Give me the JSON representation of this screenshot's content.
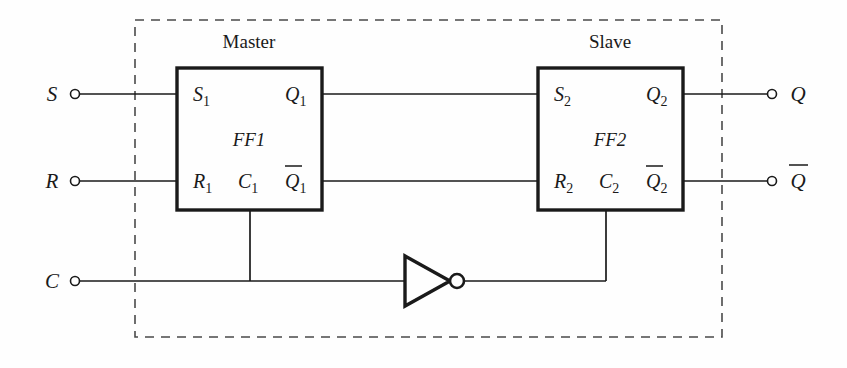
{
  "diagram": {
    "type": "logic-circuit-schematic",
    "background_color": "#fefefe",
    "line_color": "#1a1a1a",
    "dashed_boundary": {
      "present": true,
      "style": "dashed",
      "x": 135,
      "y": 20,
      "width": 587,
      "height": 317
    },
    "inputs": [
      {
        "name": "S",
        "label": "S",
        "terminal": "open-circle",
        "x": 58,
        "y": 94
      },
      {
        "name": "R",
        "label": "R",
        "terminal": "open-circle",
        "x": 58,
        "y": 181
      },
      {
        "name": "C",
        "label": "C",
        "terminal": "open-circle",
        "x": 58,
        "y": 281
      }
    ],
    "outputs": [
      {
        "name": "Q",
        "label": "Q",
        "overbar": false,
        "terminal": "open-circle",
        "x": 789,
        "y": 94
      },
      {
        "name": "Qbar",
        "label": "Q",
        "overbar": true,
        "terminal": "open-circle",
        "x": 789,
        "y": 181
      }
    ],
    "blocks": [
      {
        "id": "master",
        "title": "Master",
        "inner_label": "FF1",
        "x": 177,
        "y": 68,
        "width": 145,
        "height": 142,
        "pins": {
          "set": {
            "label": "S",
            "subscript": "1"
          },
          "reset": {
            "label": "R",
            "subscript": "1"
          },
          "clock": {
            "label": "C",
            "subscript": "1"
          },
          "q": {
            "label": "Q",
            "subscript": "1",
            "overbar": false
          },
          "qbar": {
            "label": "Q",
            "subscript": "1",
            "overbar": true
          }
        }
      },
      {
        "id": "slave",
        "title": "Slave",
        "inner_label": "FF2",
        "x": 538,
        "y": 68,
        "width": 145,
        "height": 142,
        "pins": {
          "set": {
            "label": "S",
            "subscript": "2"
          },
          "reset": {
            "label": "R",
            "subscript": "2"
          },
          "clock": {
            "label": "C",
            "subscript": "2"
          },
          "q": {
            "label": "Q",
            "subscript": "2",
            "overbar": false
          },
          "qbar": {
            "label": "Q",
            "subscript": "2",
            "overbar": true
          }
        }
      }
    ],
    "gates": [
      {
        "id": "clock-inverter",
        "type": "inverter",
        "label": "NOT",
        "x": 405,
        "y": 256,
        "width": 47,
        "height": 50,
        "bubble_radius": 7
      }
    ],
    "wires": [
      {
        "id": "s-to-master-s1",
        "from": "S",
        "to": "S1"
      },
      {
        "id": "r-to-master-r1",
        "from": "R",
        "to": "R1"
      },
      {
        "id": "c-to-master-c1",
        "from": "C",
        "to": "C1"
      },
      {
        "id": "c-to-inverter",
        "from": "C",
        "to": "inverter-input"
      },
      {
        "id": "inverter-to-slave-c2",
        "from": "inverter-output",
        "to": "C2"
      },
      {
        "id": "master-q1-to-slave-s2",
        "from": "Q1",
        "to": "S2"
      },
      {
        "id": "master-q1bar-to-slave-r2",
        "from": "Q1bar",
        "to": "R2"
      },
      {
        "id": "slave-q2-to-out-q",
        "from": "Q2",
        "to": "Q"
      },
      {
        "id": "slave-q2bar-to-out-qbar",
        "from": "Q2bar",
        "to": "Qbar"
      }
    ]
  }
}
